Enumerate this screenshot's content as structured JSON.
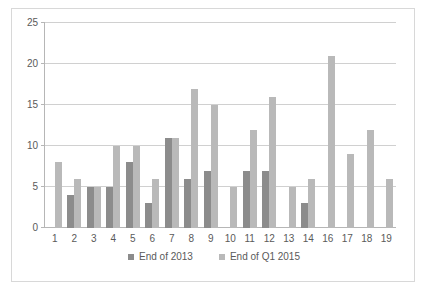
{
  "chart_data": {
    "type": "bar",
    "title": "",
    "subtitle": "",
    "xlabel": "",
    "ylabel": "",
    "ylim": [
      0,
      25
    ],
    "yticks": [
      0,
      5,
      10,
      15,
      20,
      25
    ],
    "grid": true,
    "legend_position": "bottom-center",
    "categories": [
      "1",
      "2",
      "3",
      "4",
      "5",
      "6",
      "7",
      "8",
      "9",
      "10",
      "11",
      "12",
      "13",
      "14",
      "16",
      "17",
      "18",
      "19"
    ],
    "series": [
      {
        "name": "End of 2013",
        "color": "#8c8c8c",
        "values": [
          null,
          4,
          5,
          5,
          8,
          3,
          11,
          6,
          7,
          null,
          7,
          7,
          null,
          3,
          null,
          null,
          null,
          null
        ]
      },
      {
        "name": "End of Q1 2015",
        "color": "#b9b9b9",
        "values": [
          8,
          6,
          5,
          10,
          10,
          6,
          11,
          17,
          15,
          5,
          12,
          16,
          5,
          6,
          21,
          9,
          12,
          6
        ]
      }
    ]
  },
  "colors": {
    "series_2013": "#8c8c8c",
    "series_q1_2015": "#b9b9b9",
    "gridline": "#d0d0d0",
    "axis": "#b6b6b6",
    "frame": "#d8d8d8",
    "text": "#5a5a5a"
  }
}
